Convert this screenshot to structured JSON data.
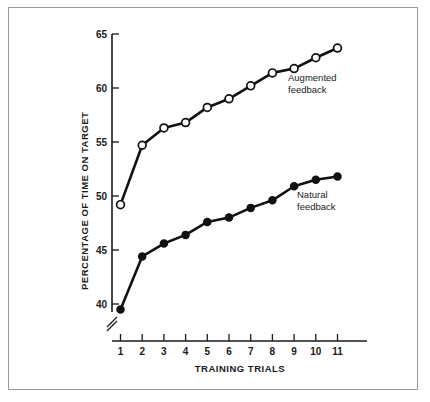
{
  "figure": {
    "border_color": "#9a9a9a",
    "background": "#ffffff"
  },
  "chart_data": {
    "type": "line",
    "title": "",
    "subtitle": "",
    "xlabel": "TRAINING TRIALS",
    "ylabel": "PERCENTAGE OF TIME ON TARGET",
    "x": [
      1,
      2,
      3,
      4,
      5,
      6,
      7,
      8,
      9,
      10,
      11
    ],
    "categories": [
      "1",
      "2",
      "3",
      "4",
      "5",
      "6",
      "7",
      "8",
      "9",
      "10",
      "11"
    ],
    "xlim": [
      0.6,
      11.8
    ],
    "ylim": [
      38.2,
      65.5
    ],
    "yticks": [
      40,
      45,
      50,
      55,
      60,
      65
    ],
    "ytick_labels": [
      "40",
      "45",
      "50",
      "55",
      "60",
      "65"
    ],
    "xticks": [
      1,
      2,
      3,
      4,
      5,
      6,
      7,
      8,
      9,
      10,
      11
    ],
    "xtick_labels": [
      "1",
      "2",
      "3",
      "4",
      "5",
      "6",
      "7",
      "8",
      "9",
      "10",
      "11"
    ],
    "grid": false,
    "legend_position": "inline-annotation",
    "y_axis_break": true,
    "y_axis_break_note": "axis break below 40",
    "series": [
      {
        "name": "Augmented feedback",
        "marker": "open-circle",
        "color": "#111111",
        "values": [
          49.2,
          54.7,
          56.3,
          56.8,
          58.2,
          59.0,
          60.2,
          61.4,
          61.8,
          62.8,
          63.7
        ]
      },
      {
        "name": "Natural feedback",
        "marker": "filled-circle",
        "color": "#111111",
        "values": [
          39.5,
          44.4,
          45.6,
          46.4,
          47.6,
          48.0,
          48.9,
          49.6,
          50.9,
          51.5,
          51.8
        ]
      }
    ],
    "annotations": [
      {
        "text_line1": "Augmented",
        "text_line2": "feedback",
        "series": "Augmented feedback"
      },
      {
        "text_line1": "Natural",
        "text_line2": "feedback",
        "series": "Natural feedback"
      }
    ]
  }
}
